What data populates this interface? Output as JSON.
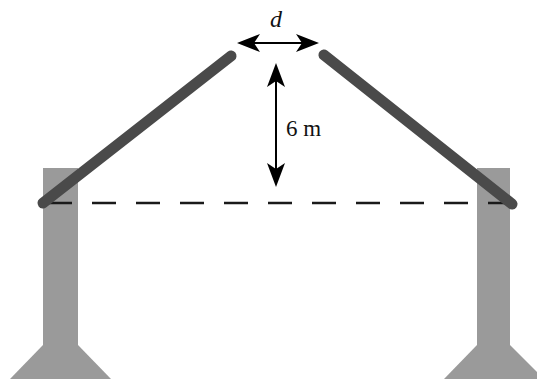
{
  "diagram": {
    "type": "gable-roof-structure",
    "labels": {
      "gap": "d",
      "height": "6 m"
    },
    "colors": {
      "pillar": "#9a9a9a",
      "beam": "#4a4a4a",
      "arrow": "#000000",
      "dashed_line": "#1a1a1a",
      "background": "#ffffff"
    },
    "elements": {
      "left_pillar": {
        "x1": 43,
        "x2": 78,
        "top": 168,
        "base_start": 345,
        "base_bottom": 379,
        "base_left": 10,
        "base_right": 111
      },
      "right_pillar": {
        "x1": 477,
        "x2": 510,
        "top": 168,
        "base_start": 345,
        "base_bottom": 379,
        "base_left": 444,
        "base_right": 537
      },
      "left_beam": {
        "x1": 43,
        "y1": 203,
        "x2": 231,
        "y2": 56
      },
      "right_beam": {
        "x1": 324,
        "y1": 55,
        "x2": 512,
        "y2": 204
      },
      "dashed_line": {
        "y": 203,
        "x1": 46,
        "x2": 512
      },
      "gap_arrow": {
        "y": 43,
        "x1": 237,
        "x2": 319
      },
      "height_arrow": {
        "x": 276,
        "y1": 63,
        "y2": 187
      }
    }
  }
}
